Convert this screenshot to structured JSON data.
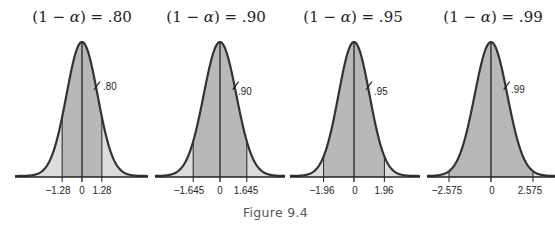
{
  "caption": "Figure 9.4",
  "colors": {
    "curve": "#333333",
    "tail_fill": "#dcdcdc",
    "inner_fill": "#b8b8b8",
    "axis": "#222222"
  },
  "panels": [
    {
      "title_prefix": "(1 − ",
      "title_alpha": "α",
      "title_suffix": ") = .80",
      "area_label": ".80",
      "ticks": [
        "−1.28",
        "0",
        "1.28"
      ]
    },
    {
      "title_prefix": "(1 − ",
      "title_alpha": "α",
      "title_suffix": ") = .90",
      "area_label": ".90",
      "ticks": [
        "−1.645",
        "0",
        "1.645"
      ]
    },
    {
      "title_prefix": "(1 − ",
      "title_alpha": "α",
      "title_suffix": ") = .95",
      "area_label": ".95",
      "ticks": [
        "−1.96",
        "0",
        "1.96"
      ]
    },
    {
      "title_prefix": "(1 − ",
      "title_alpha": "α",
      "title_suffix": ") = .99",
      "area_label": ".99",
      "ticks": [
        "−2.575",
        "0",
        "2.575"
      ]
    }
  ],
  "chart_data": [
    {
      "type": "area",
      "title": "(1 − α) = .80",
      "distribution": "standard normal",
      "shaded_central_area": 0.8,
      "critical_values": [
        -1.28,
        1.28
      ],
      "tick_labels": [
        "−1.28",
        "0",
        "1.28"
      ],
      "annotation": ".80",
      "xlabel": "",
      "ylabel": ""
    },
    {
      "type": "area",
      "title": "(1 − α) = .90",
      "distribution": "standard normal",
      "shaded_central_area": 0.9,
      "critical_values": [
        -1.645,
        1.645
      ],
      "tick_labels": [
        "−1.645",
        "0",
        "1.645"
      ],
      "annotation": ".90",
      "xlabel": "",
      "ylabel": ""
    },
    {
      "type": "area",
      "title": "(1 − α) = .95",
      "distribution": "standard normal",
      "shaded_central_area": 0.95,
      "critical_values": [
        -1.96,
        1.96
      ],
      "tick_labels": [
        "−1.96",
        "0",
        "1.96"
      ],
      "annotation": ".95",
      "xlabel": "",
      "ylabel": ""
    },
    {
      "type": "area",
      "title": "(1 − α) = .99",
      "distribution": "standard normal",
      "shaded_central_area": 0.99,
      "critical_values": [
        -2.575,
        2.575
      ],
      "tick_labels": [
        "−2.575",
        "0",
        "2.575"
      ],
      "annotation": ".99",
      "xlabel": "",
      "ylabel": ""
    }
  ]
}
